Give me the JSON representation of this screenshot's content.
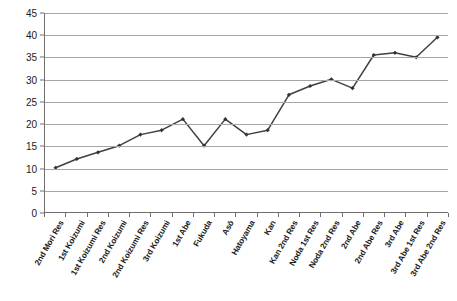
{
  "chart_data": {
    "type": "line",
    "title": "",
    "subtitle": "",
    "xlabel": "",
    "ylabel": "",
    "ylim": [
      0,
      45
    ],
    "ytick_step": 5,
    "yticks": [
      0,
      5,
      10,
      15,
      20,
      25,
      30,
      35,
      40,
      45
    ],
    "grid": true,
    "legend": "none",
    "marker": "diamond",
    "line_color": "#404040",
    "marker_color": "#333333",
    "grid_color": "#a6a6a6",
    "axis_color": "#6e6e6e",
    "categories": [
      "2nd Mori Res",
      "1st Koizumi",
      "1st Koizumi Res",
      "2nd Koizumi",
      "2nd Koizumi Res",
      "3rd Koizumi",
      "1st Abe",
      "Fukuda",
      "Asō",
      "Hatoyama",
      "Kan",
      "Kan 2nd Res",
      "Noda 1st Res",
      "Noda 2nd Res",
      "2nd Abe",
      "2nd Abe Res",
      "3rd Abe",
      "3rd Abe 1st Res",
      "3rd Abe 2nd Res"
    ],
    "series": [
      {
        "name": "",
        "values": [
          10,
          12,
          13.5,
          15,
          17.5,
          18.5,
          21,
          15,
          21,
          17.5,
          18.5,
          26.5,
          28.5,
          30,
          28,
          35.5,
          36,
          35,
          39.5
        ]
      }
    ]
  }
}
